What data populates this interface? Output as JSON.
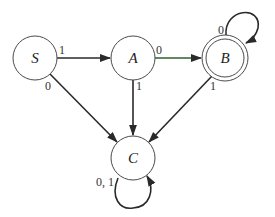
{
  "diagram": {
    "type": "finite-state-machine",
    "states": [
      {
        "id": "S",
        "label": "S",
        "accepting": false,
        "start": true
      },
      {
        "id": "A",
        "label": "A",
        "accepting": false
      },
      {
        "id": "B",
        "label": "B",
        "accepting": true
      },
      {
        "id": "C",
        "label": "C",
        "accepting": false
      }
    ],
    "transitions": [
      {
        "from": "S",
        "to": "A",
        "label": "1"
      },
      {
        "from": "S",
        "to": "C",
        "label": "0"
      },
      {
        "from": "A",
        "to": "B",
        "label": "0",
        "color": "#2f5e2f"
      },
      {
        "from": "A",
        "to": "C",
        "label": "1"
      },
      {
        "from": "B",
        "to": "B",
        "label": "0"
      },
      {
        "from": "B",
        "to": "C",
        "label": "1"
      },
      {
        "from": "C",
        "to": "C",
        "label": "0, 1"
      }
    ]
  },
  "labels": {
    "S": "S",
    "A": "A",
    "B": "B",
    "C": "C",
    "s_to_a": "1",
    "s_to_c": "0",
    "a_to_b": "0",
    "a_to_c": "1",
    "b_self": "0",
    "b_to_c": "1",
    "c_self": "0, 1"
  }
}
